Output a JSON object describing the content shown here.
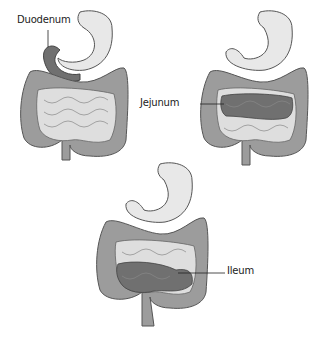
{
  "diagram": {
    "panels": [
      {
        "id": "duodenum",
        "label": "Duodenum"
      },
      {
        "id": "jejunum",
        "label": "Jejunum"
      },
      {
        "id": "ileum",
        "label": "Ileum"
      }
    ],
    "colors": {
      "stomach": "#e6e6e6",
      "colon": "#9a9a9a",
      "colon_dark": "#6e6e6e",
      "small_intestine_light": "#dcdcdc",
      "highlight": "#6f6f6f",
      "outline": "#444444",
      "leader_line": "#222222"
    }
  }
}
